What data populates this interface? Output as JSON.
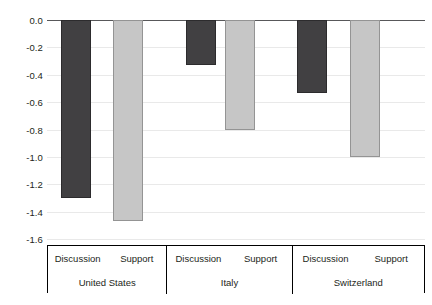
{
  "chart_data": {
    "type": "bar",
    "title": "",
    "subtitle": "",
    "xlabel": "",
    "ylabel": "",
    "ylim": [
      -1.6,
      0.0
    ],
    "ytick_labels": [
      "0.0",
      "-0.2",
      "-0.4",
      "-0.6",
      "-0.8",
      "-1.0",
      "-1.2",
      "-1.4",
      "-1.6"
    ],
    "ytick_values": [
      0.0,
      -0.2,
      -0.4,
      -0.6,
      -0.8,
      -1.0,
      -1.2,
      -1.4,
      -1.6
    ],
    "grid": true,
    "legend_position": "none",
    "orientation": "vertical",
    "categories": [
      "United States",
      "Italy",
      "Switzerland"
    ],
    "series": [
      {
        "name": "Discussion",
        "color": "#414042",
        "values": [
          -1.3,
          -0.33,
          -0.53
        ]
      },
      {
        "name": "Support",
        "color": "#c6c6c6",
        "values": [
          -1.47,
          -0.8,
          -1.0
        ]
      }
    ],
    "groups": [
      {
        "category": "United States",
        "bars": [
          {
            "series": "Discussion",
            "value": -1.3,
            "color": "#414042"
          },
          {
            "series": "Support",
            "value": -1.47,
            "color": "#c6c6c6"
          }
        ]
      },
      {
        "category": "Italy",
        "bars": [
          {
            "series": "Discussion",
            "value": -0.33,
            "color": "#414042"
          },
          {
            "series": "Support",
            "value": -0.8,
            "color": "#c6c6c6"
          }
        ]
      },
      {
        "category": "Switzerland",
        "bars": [
          {
            "series": "Discussion",
            "value": -0.53,
            "color": "#414042"
          },
          {
            "series": "Support",
            "value": -1.0,
            "color": "#c6c6c6"
          }
        ]
      }
    ]
  },
  "axis": {
    "y_labels": [
      "0.0",
      "-0.2",
      "-0.4",
      "-0.6",
      "-0.8",
      "-1.0",
      "-1.2",
      "-1.4",
      "-1.6"
    ]
  },
  "label_table": {
    "series_row": [
      "Discussion",
      "Support",
      "Discussion",
      "Support",
      "Discussion",
      "Support"
    ],
    "country_row": [
      "United States",
      "Italy",
      "Switzerland"
    ]
  },
  "colors": {
    "dark_bar": "#414042",
    "light_bar": "#c6c6c6",
    "grid": "#e9e9e9",
    "axis": "#58585a",
    "text": "#231f20",
    "background": "#ffffff"
  }
}
